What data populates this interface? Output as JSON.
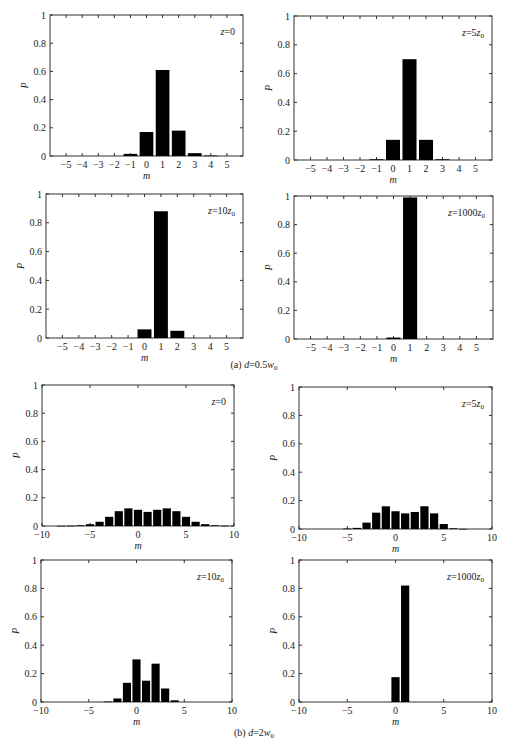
{
  "figure": {
    "captions": [
      "(a) d=0.5w0",
      "(b) d=2w0"
    ]
  },
  "chart_data": [
    {
      "type": "bar",
      "group": "(a) d=0.5w0",
      "annotation": "z=0",
      "xlabel": "m",
      "ylabel": "P",
      "ylim": [
        0,
        1
      ],
      "xlim": [
        -6,
        6
      ],
      "xticks": [
        -5,
        -4,
        -3,
        -2,
        -1,
        0,
        1,
        2,
        3,
        4,
        5
      ],
      "yticks": [
        0,
        0.2,
        0.4,
        0.6,
        0.8,
        1
      ],
      "x": [
        -1,
        0,
        1,
        2,
        3,
        4
      ],
      "values": [
        0.015,
        0.17,
        0.61,
        0.18,
        0.02,
        0.003
      ]
    },
    {
      "type": "bar",
      "group": "(a) d=0.5w0",
      "annotation": "z=5z0",
      "xlabel": "m",
      "ylabel": "P",
      "ylim": [
        0,
        1
      ],
      "xlim": [
        -6,
        6
      ],
      "xticks": [
        -5,
        -4,
        -3,
        -2,
        -1,
        0,
        1,
        2,
        3,
        4,
        5
      ],
      "yticks": [
        0,
        0.2,
        0.4,
        0.6,
        0.8,
        1
      ],
      "x": [
        -1,
        0,
        1,
        2,
        3
      ],
      "values": [
        0.005,
        0.14,
        0.7,
        0.14,
        0.005
      ]
    },
    {
      "type": "bar",
      "group": "(a) d=0.5w0",
      "annotation": "z=10z0",
      "xlabel": "m",
      "ylabel": "P",
      "ylim": [
        0,
        1
      ],
      "xlim": [
        -6,
        6
      ],
      "xticks": [
        -5,
        -4,
        -3,
        -2,
        -1,
        0,
        1,
        2,
        3,
        4,
        5
      ],
      "yticks": [
        0,
        0.2,
        0.4,
        0.6,
        0.8,
        1
      ],
      "x": [
        0,
        1,
        2
      ],
      "values": [
        0.06,
        0.88,
        0.05
      ]
    },
    {
      "type": "bar",
      "group": "(a) d=0.5w0",
      "annotation": "z=1000z0",
      "xlabel": "m",
      "ylabel": "P",
      "ylim": [
        0,
        1
      ],
      "xlim": [
        -6,
        6
      ],
      "xticks": [
        -5,
        -4,
        -3,
        -2,
        -1,
        0,
        1,
        2,
        3,
        4,
        5
      ],
      "yticks": [
        0,
        0.2,
        0.4,
        0.6,
        0.8,
        1
      ],
      "x": [
        0,
        1
      ],
      "values": [
        0.01,
        0.99
      ]
    },
    {
      "type": "bar",
      "group": "(b) d=2w0",
      "annotation": "z=0",
      "xlabel": "m",
      "ylabel": "P",
      "ylim": [
        0,
        1
      ],
      "xlim": [
        -10,
        10
      ],
      "xticks": [
        -10,
        -5,
        0,
        5,
        10
      ],
      "yticks": [
        0,
        0.2,
        0.4,
        0.6,
        0.8,
        1
      ],
      "x": [
        -8,
        -7,
        -6,
        -5,
        -4,
        -3,
        -2,
        -1,
        0,
        1,
        2,
        3,
        4,
        5,
        6,
        7,
        8,
        9
      ],
      "values": [
        0.001,
        0.002,
        0.005,
        0.013,
        0.03,
        0.065,
        0.105,
        0.125,
        0.115,
        0.1,
        0.115,
        0.125,
        0.105,
        0.065,
        0.03,
        0.013,
        0.005,
        0.002
      ]
    },
    {
      "type": "bar",
      "group": "(b) d=2w0",
      "annotation": "z=5z0",
      "xlabel": "m",
      "ylabel": "P",
      "ylim": [
        0,
        1
      ],
      "xlim": [
        -10,
        10
      ],
      "xticks": [
        -10,
        -5,
        0,
        5,
        10
      ],
      "yticks": [
        0,
        0.2,
        0.4,
        0.6,
        0.8,
        1
      ],
      "x": [
        -5,
        -4,
        -3,
        -2,
        -1,
        0,
        1,
        2,
        3,
        4,
        5,
        6,
        7
      ],
      "values": [
        0.003,
        0.008,
        0.045,
        0.115,
        0.16,
        0.125,
        0.11,
        0.12,
        0.16,
        0.11,
        0.035,
        0.005,
        0.001
      ]
    },
    {
      "type": "bar",
      "group": "(b) d=2w0",
      "annotation": "z=10z0",
      "xlabel": "m",
      "ylabel": "P",
      "ylim": [
        0,
        1
      ],
      "xlim": [
        -10,
        10
      ],
      "xticks": [
        -10,
        -5,
        0,
        5,
        10
      ],
      "yticks": [
        0,
        0.2,
        0.4,
        0.6,
        0.8,
        1
      ],
      "x": [
        -3,
        -2,
        -1,
        0,
        1,
        2,
        3,
        4
      ],
      "values": [
        0.003,
        0.025,
        0.135,
        0.3,
        0.15,
        0.27,
        0.095,
        0.012
      ]
    },
    {
      "type": "bar",
      "group": "(b) d=2w0",
      "annotation": "z=1000z0",
      "xlabel": "m",
      "ylabel": "P",
      "ylim": [
        0,
        1
      ],
      "xlim": [
        -10,
        10
      ],
      "xticks": [
        -10,
        -5,
        0,
        5,
        10
      ],
      "yticks": [
        0,
        0.2,
        0.4,
        0.6,
        0.8,
        1
      ],
      "x": [
        0,
        1
      ],
      "values": [
        0.175,
        0.82
      ]
    }
  ]
}
